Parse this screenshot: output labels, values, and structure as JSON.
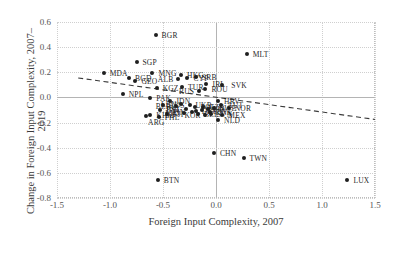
{
  "chart_data": {
    "type": "scatter",
    "title": "",
    "xlabel": "Foreign Input Complexity, 2007",
    "ylabel": "Change in Foreign Input Complexity, 2007–2019",
    "xlim": [
      -1.5,
      1.5
    ],
    "ylim": [
      -0.8,
      0.6
    ],
    "xticks": [
      "-1.5",
      "-1.0",
      "-0.5",
      "0.0",
      "0.5",
      "1.0",
      "1.5"
    ],
    "xtick_values": [
      -1.5,
      -1.0,
      -0.5,
      0.0,
      0.5,
      1.0,
      1.5
    ],
    "yticks": [
      "0.6",
      "0.4",
      "0.2",
      "0.0",
      "-0.2",
      "-0.4",
      "-0.6",
      "-0.8"
    ],
    "ytick_values": [
      0.6,
      0.4,
      0.2,
      0.0,
      -0.2,
      -0.4,
      -0.6,
      -0.8
    ],
    "grid": true,
    "legend": "none",
    "marker_color": "#1f1f1f",
    "grid_color": "#cfcfcf",
    "axis_color": "#b4b4b4",
    "trend_line": {
      "style": "dashed",
      "color": "#3a3a3a",
      "x0": -1.3,
      "y0": 0.155,
      "x1": 1.5,
      "y1": -0.175
    },
    "points": [
      {
        "label": "BGR",
        "x": -0.57,
        "y": 0.495,
        "lx": 6,
        "ly": 0
      },
      {
        "label": "MLT",
        "x": 0.29,
        "y": 0.345,
        "lx": 6,
        "ly": 0
      },
      {
        "label": "SGP",
        "x": -0.75,
        "y": 0.285,
        "lx": 6,
        "ly": 0
      },
      {
        "label": "MDA",
        "x": -1.06,
        "y": 0.198,
        "lx": 6,
        "ly": 0
      },
      {
        "label": "MNG",
        "x": -0.6,
        "y": 0.198,
        "lx": 6,
        "ly": 0
      },
      {
        "label": "BGD",
        "x": -0.82,
        "y": 0.153,
        "lx": 6,
        "ly": 0
      },
      {
        "label": "GEO",
        "x": -0.76,
        "y": 0.133,
        "lx": 6,
        "ly": 0
      },
      {
        "label": "HKG",
        "x": -0.33,
        "y": 0.178,
        "lx": 6,
        "ly": 0
      },
      {
        "label": "SRB",
        "x": -0.19,
        "y": 0.16,
        "lx": 6,
        "ly": 0
      },
      {
        "label": "CYP",
        "x": -0.27,
        "y": 0.152,
        "lx": 6,
        "ly": 0
      },
      {
        "label": "ALB",
        "x": -0.36,
        "y": 0.143,
        "lx": -20,
        "ly": 0
      },
      {
        "label": "KGZ",
        "x": -0.56,
        "y": 0.075,
        "lx": 6,
        "ly": 0
      },
      {
        "label": "TUR",
        "x": -0.32,
        "y": 0.085,
        "lx": 6,
        "ly": 0
      },
      {
        "label": "IRL",
        "x": -0.09,
        "y": 0.108,
        "lx": 6,
        "ly": 0
      },
      {
        "label": "SVK",
        "x": 0.06,
        "y": 0.095,
        "lx": 9,
        "ly": 0
      },
      {
        "label": "ROU",
        "x": -0.1,
        "y": 0.068,
        "lx": 6,
        "ly": 0
      },
      {
        "label": "RUS",
        "x": -0.16,
        "y": 0.05,
        "lx": -20,
        "ly": 0
      },
      {
        "label": "NPL",
        "x": -0.88,
        "y": 0.028,
        "lx": 6,
        "ly": 0
      },
      {
        "label": "PAK",
        "x": -0.62,
        "y": -0.005,
        "lx": 6,
        "ly": 0
      },
      {
        "label": "IDN",
        "x": -0.43,
        "y": -0.03,
        "lx": 6,
        "ly": 0
      },
      {
        "label": "AUS",
        "x": -0.5,
        "y": -0.058,
        "lx": 6,
        "ly": 0
      },
      {
        "label": "JPN",
        "x": -0.53,
        "y": -0.098,
        "lx": 6,
        "ly": 0
      },
      {
        "label": "HRV",
        "x": 0.02,
        "y": -0.028,
        "lx": 6,
        "ly": 0
      },
      {
        "label": "AUT",
        "x": 0.05,
        "y": -0.058,
        "lx": 6,
        "ly": 0
      },
      {
        "label": "SWE",
        "x": -0.02,
        "y": -0.088,
        "lx": 6,
        "ly": 0
      },
      {
        "label": "NOR",
        "x": 0.12,
        "y": -0.088,
        "lx": 6,
        "ly": 0
      },
      {
        "label": "LBN",
        "x": -0.33,
        "y": -0.055,
        "lx": -20,
        "ly": 0
      },
      {
        "label": "BLR",
        "x": -0.38,
        "y": -0.072,
        "lx": -20,
        "ly": 0
      },
      {
        "label": "UKR",
        "x": -0.25,
        "y": -0.062,
        "lx": 6,
        "ly": 0
      },
      {
        "label": "POL",
        "x": -0.2,
        "y": -0.075,
        "lx": 6,
        "ly": 0
      },
      {
        "label": "CZE",
        "x": -0.12,
        "y": -0.08,
        "lx": 6,
        "ly": 0
      },
      {
        "label": "ITA",
        "x": -0.08,
        "y": -0.092,
        "lx": 6,
        "ly": 0
      },
      {
        "label": "LVA",
        "x": -0.13,
        "y": -0.1,
        "lx": 6,
        "ly": 0
      },
      {
        "label": "EST",
        "x": -0.28,
        "y": -0.095,
        "lx": -20,
        "ly": 0
      },
      {
        "label": "DEU",
        "x": -0.19,
        "y": -0.105,
        "lx": 6,
        "ly": 0
      },
      {
        "label": "FIN",
        "x": -0.23,
        "y": -0.112,
        "lx": -19,
        "ly": 0
      },
      {
        "label": "DNK",
        "x": -0.06,
        "y": -0.112,
        "lx": 6,
        "ly": 0
      },
      {
        "label": "LTU",
        "x": -0.3,
        "y": -0.122,
        "lx": -19,
        "ly": 0
      },
      {
        "label": "BEL",
        "x": -0.17,
        "y": -0.135,
        "lx": 6,
        "ly": 0
      },
      {
        "label": "SVN",
        "x": -0.05,
        "y": -0.135,
        "lx": 6,
        "ly": 0
      },
      {
        "label": "MEX",
        "x": 0.06,
        "y": -0.138,
        "lx": 6,
        "ly": 0
      },
      {
        "label": "KOR",
        "x": -0.1,
        "y": -0.142,
        "lx": -21,
        "ly": 0
      },
      {
        "label": "FJI",
        "x": -0.46,
        "y": -0.132,
        "lx": 6,
        "ly": 0
      },
      {
        "label": "KHM",
        "x": -0.62,
        "y": -0.138,
        "lx": 6,
        "ly": 0
      },
      {
        "label": "ARG",
        "x": -0.66,
        "y": -0.148,
        "lx": 2,
        "ly": 6
      },
      {
        "label": "PHL",
        "x": -0.54,
        "y": -0.158,
        "lx": 6,
        "ly": 0
      },
      {
        "label": "NLD",
        "x": 0.02,
        "y": -0.182,
        "lx": 6,
        "ly": 0
      },
      {
        "label": "CHN",
        "x": -0.02,
        "y": -0.445,
        "lx": 6,
        "ly": 0
      },
      {
        "label": "TWN",
        "x": 0.26,
        "y": -0.478,
        "lx": 6,
        "ly": 0
      },
      {
        "label": "BTN",
        "x": -0.55,
        "y": -0.655,
        "lx": 6,
        "ly": 0
      },
      {
        "label": "LUX",
        "x": 1.24,
        "y": -0.655,
        "lx": 6,
        "ly": 0
      }
    ]
  }
}
